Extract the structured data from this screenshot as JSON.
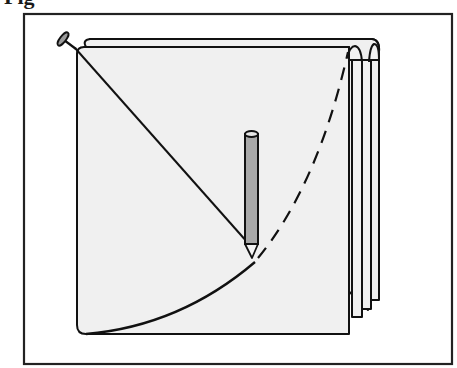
{
  "figure": {
    "label": "Fig",
    "parts": [
      {
        "name": "tack",
        "role": "pivot point at top-left corner"
      },
      {
        "name": "string",
        "role": "radius from tack to pencil tip"
      },
      {
        "name": "pencil",
        "role": "tracing tool"
      },
      {
        "name": "arc-drawn",
        "style": "solid",
        "role": "portion of arc already drawn"
      },
      {
        "name": "arc-remaining",
        "style": "dashed",
        "role": "portion of arc still to be drawn"
      },
      {
        "name": "paper-stack",
        "role": "stack of sheets with curled right edges"
      }
    ]
  },
  "colors": {
    "frame": "#222222",
    "paper_fill": "#f0f0f0",
    "pencil_fill": "#a8a8a8",
    "tack_fill": "#9a9a9a",
    "stroke": "#111111"
  }
}
